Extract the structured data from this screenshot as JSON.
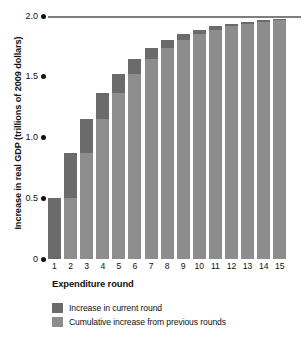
{
  "chart_data": {
    "type": "bar",
    "title": "",
    "subtitle": "",
    "xlabel": "Expenditure round",
    "ylabel": "Increase in real GDP (trillions of 2009 dollars)",
    "categories": [
      "1",
      "2",
      "3",
      "4",
      "5",
      "6",
      "7",
      "8",
      "9",
      "10",
      "11",
      "12",
      "13",
      "14",
      "15"
    ],
    "ylim": [
      0,
      2.0
    ],
    "yticks": [
      {
        "value": 0,
        "label": "0"
      },
      {
        "value": 0.5,
        "label": "0.5"
      },
      {
        "value": 1.0,
        "label": "1.0"
      },
      {
        "value": 1.5,
        "label": "1.5"
      },
      {
        "value": 2.0,
        "label": "2.0"
      }
    ],
    "grid": false,
    "stacked": true,
    "legend_position": "bottom-left",
    "annotations": [
      {
        "type": "reference-line",
        "value": 2.0,
        "label": "",
        "orientation": "horizontal"
      }
    ],
    "series": [
      {
        "name": "Cumulative increase from previous rounds",
        "color": "#8d8d8d",
        "values": [
          0,
          0.5,
          0.875,
          1.156,
          1.367,
          1.525,
          1.644,
          1.733,
          1.8,
          1.85,
          1.887,
          1.916,
          1.937,
          1.952,
          1.964
        ]
      },
      {
        "name": "Increase in current round",
        "color": "#6b6b6b",
        "values": [
          0.5,
          0.375,
          0.281,
          0.211,
          0.158,
          0.119,
          0.089,
          0.067,
          0.05,
          0.037,
          0.029,
          0.021,
          0.015,
          0.012,
          0.009
        ]
      }
    ],
    "totals": [
      0.5,
      0.875,
      1.156,
      1.367,
      1.525,
      1.644,
      1.733,
      1.8,
      1.85,
      1.887,
      1.916,
      1.937,
      1.952,
      1.964,
      1.973
    ]
  },
  "legend": {
    "items": [
      {
        "label": "Increase in current round",
        "color": "#6b6b6b"
      },
      {
        "label": "Cumulative increase from previous rounds",
        "color": "#8d8d8d"
      }
    ]
  }
}
